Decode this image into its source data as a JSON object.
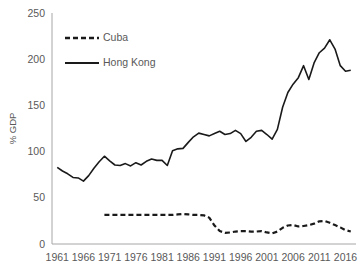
{
  "chart_data": {
    "type": "line",
    "title": "",
    "subtitle": "",
    "xlabel": "",
    "ylabel": "% GDP",
    "xlim": [
      1960,
      2018
    ],
    "ylim": [
      0,
      250
    ],
    "grid": false,
    "legend_position": "top-left",
    "y_ticks": [
      0,
      50,
      100,
      150,
      200,
      250
    ],
    "y_tick_labels": [
      "0",
      "50",
      "100",
      "150",
      "200",
      "250"
    ],
    "x_ticks": [
      1961,
      1966,
      1971,
      1976,
      1981,
      1986,
      1991,
      1996,
      2001,
      2006,
      2011,
      2016
    ],
    "x_tick_labels": [
      "1961",
      "1966",
      "1971",
      "1976",
      "1981",
      "1986",
      "1991",
      "1996",
      "2001",
      "2006",
      "2011",
      "2016"
    ],
    "series": [
      {
        "name": "Cuba",
        "style": "dashed",
        "color": "#1a1a1a",
        "x": [
          1970,
          1971,
          1972,
          1973,
          1974,
          1975,
          1976,
          1977,
          1978,
          1979,
          1980,
          1981,
          1982,
          1983,
          1984,
          1985,
          1986,
          1987,
          1988,
          1989,
          1990,
          1991,
          1992,
          1993,
          1994,
          1995,
          1996,
          1997,
          1998,
          1999,
          2000,
          2001,
          2002,
          2003,
          2004,
          2005,
          2006,
          2007,
          2008,
          2009,
          2010,
          2011,
          2012,
          2013,
          2014,
          2015,
          2016,
          2017
        ],
        "values": [
          31.5,
          31.5,
          31.5,
          31.5,
          31.5,
          31.5,
          31.5,
          31.5,
          31.5,
          31.5,
          31.5,
          31.5,
          31.5,
          31.5,
          32.0,
          32.5,
          32.0,
          31.5,
          31.5,
          31.0,
          28.5,
          20.0,
          14.0,
          12.0,
          12.5,
          13.5,
          14.0,
          14.0,
          13.5,
          13.5,
          14.0,
          12.5,
          11.5,
          13.5,
          17.5,
          20.0,
          20.5,
          19.0,
          19.5,
          20.5,
          22.0,
          24.5,
          25.0,
          23.0,
          20.5,
          18.0,
          15.0,
          13.5
        ]
      },
      {
        "name": "Hong Kong",
        "style": "solid",
        "color": "#1a1a1a",
        "x": [
          1961,
          1962,
          1963,
          1964,
          1965,
          1966,
          1967,
          1968,
          1969,
          1970,
          1971,
          1972,
          1973,
          1974,
          1975,
          1976,
          1977,
          1978,
          1979,
          1980,
          1981,
          1982,
          1983,
          1984,
          1985,
          1986,
          1987,
          1988,
          1989,
          1990,
          1991,
          1992,
          1993,
          1994,
          1995,
          1996,
          1997,
          1998,
          1999,
          2000,
          2001,
          2002,
          2003,
          2004,
          2005,
          2006,
          2007,
          2008,
          2009,
          2010,
          2011,
          2012,
          2013,
          2014,
          2015,
          2016,
          2017
        ],
        "values": [
          83.0,
          79.0,
          76.0,
          72.0,
          71.5,
          68.0,
          74.0,
          82.0,
          89.0,
          95.0,
          90.0,
          85.5,
          85.0,
          87.0,
          84.5,
          88.0,
          85.5,
          89.5,
          92.0,
          90.5,
          90.5,
          85.0,
          101.0,
          103.0,
          103.5,
          110.0,
          116.0,
          120.0,
          118.5,
          117.0,
          119.5,
          122.0,
          118.5,
          119.5,
          123.0,
          119.5,
          111.0,
          115.5,
          122.0,
          123.0,
          118.5,
          113.5,
          124.0,
          148.0,
          164.0,
          173.0,
          180.0,
          193.0,
          178.0,
          196.0,
          207.0,
          212.0,
          221.0,
          211.0,
          193.0,
          187.0,
          188.0
        ]
      }
    ]
  },
  "legend": {
    "items": [
      {
        "label": "Cuba",
        "style": "dashed"
      },
      {
        "label": "Hong Kong",
        "style": "solid"
      }
    ]
  }
}
